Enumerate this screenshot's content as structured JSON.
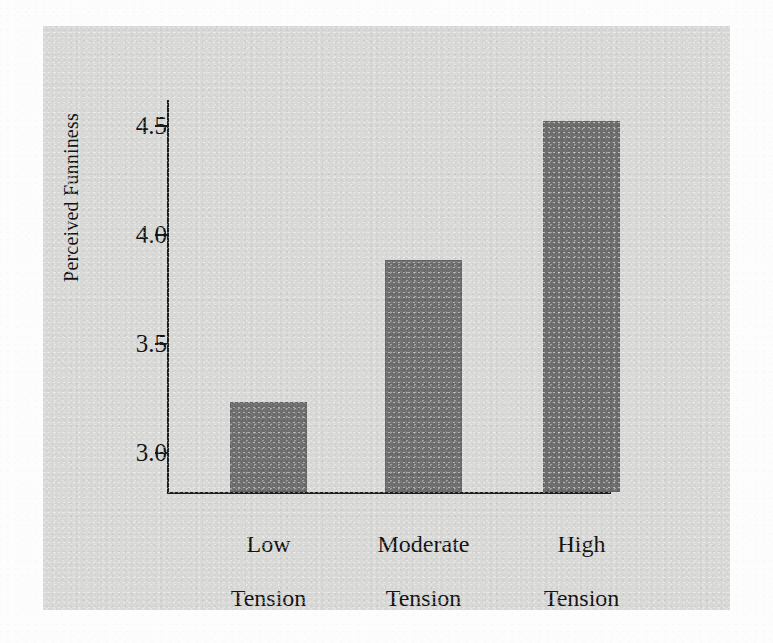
{
  "chart_data": {
    "type": "bar",
    "title": "",
    "subtitle": "",
    "xlabel": "",
    "ylabel": "Perceived Funniness",
    "categories": [
      "Low\nTension",
      "Moderate\nTension",
      "High\nTension"
    ],
    "category_labels_flat": [
      "Low Tension",
      "Moderate Tension",
      "High Tension"
    ],
    "values": [
      3.23,
      3.88,
      4.52
    ],
    "ylim": [
      2.78,
      4.8
    ],
    "yticks": [
      3.0,
      3.5,
      4.0,
      4.5
    ],
    "ytick_labels": [
      "3.0",
      "3.5",
      "4.0",
      "4.5"
    ],
    "grid": false,
    "legend": "none",
    "bar_color": "#6f6f6f",
    "axis_color": "#1e1e1e",
    "panel_color": "#d9d9d7",
    "page_color": "#fdfdfd",
    "series": [
      {
        "name": "Perceived Funniness",
        "values": [
          3.23,
          3.88,
          4.52
        ]
      }
    ]
  },
  "figure": {
    "y_axis_title": "Perceived Funniness",
    "yticks": [
      {
        "label": "3.0",
        "value": 3.0
      },
      {
        "label": "3.5",
        "value": 3.5
      },
      {
        "label": "4.0",
        "value": 4.0
      },
      {
        "label": "4.5",
        "value": 4.5
      }
    ],
    "bars": [
      {
        "label_line1": "Low",
        "label_line2": "Tension",
        "value": 3.23
      },
      {
        "label_line1": "Moderate",
        "label_line2": "Tension",
        "value": 3.88
      },
      {
        "label_line1": "High",
        "label_line2": "Tension",
        "value": 4.52
      }
    ]
  }
}
